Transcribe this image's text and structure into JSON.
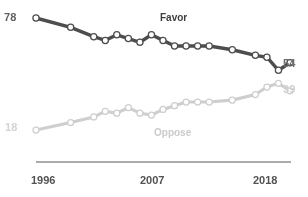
{
  "chart_data": {
    "type": "line",
    "title": "",
    "subtitle": "",
    "xlabel": "",
    "ylabel": "",
    "xlim": [
      1996,
      2018
    ],
    "ylim": [
      0,
      85
    ],
    "grid": false,
    "legend_position": "inline-labels",
    "x": [
      1996,
      1999,
      2001,
      2002,
      2003,
      2004,
      2005,
      2006,
      2007,
      2008,
      2009,
      2010,
      2011,
      2013,
      2015,
      2016,
      2017,
      2018
    ],
    "xticks": [
      "1996",
      "2007",
      "2018"
    ],
    "series": [
      {
        "name": "Favor",
        "color": "#4a4a4a",
        "start_value": 78,
        "end_value": 54,
        "values": [
          78,
          73,
          68,
          66,
          69,
          67,
          65,
          69,
          66,
          63,
          63,
          63,
          63,
          61,
          58,
          57,
          50,
          54
        ]
      },
      {
        "name": "Oppose",
        "color": "#cccccc",
        "start_value": 18,
        "end_value": 39,
        "values": [
          18,
          22,
          25,
          28,
          27,
          30,
          27,
          26,
          29,
          31,
          33,
          33,
          33,
          34,
          37,
          41,
          43,
          39
        ]
      }
    ],
    "annotations": {
      "favor_label": "Favor",
      "oppose_label": "Oppose",
      "favor_start_label": "78",
      "favor_end_label": "54",
      "oppose_start_label": "18",
      "oppose_end_label": "39"
    }
  }
}
